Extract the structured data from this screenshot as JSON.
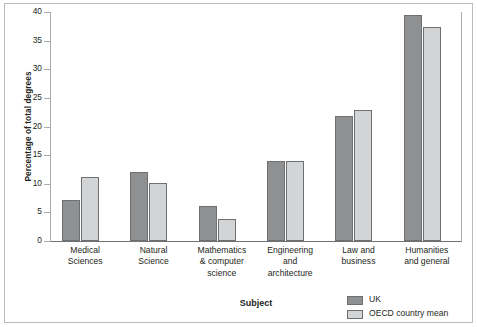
{
  "chart_data": {
    "type": "bar",
    "title": "",
    "xlabel": "Subject",
    "ylabel": "Percentage of total degrees",
    "ylim": [
      0,
      40
    ],
    "yticks": [
      0,
      5,
      10,
      15,
      20,
      25,
      30,
      35,
      40
    ],
    "grid": false,
    "legend_position": "bottom-right",
    "categories": [
      "Medical\nSciences",
      "Natural\nScience",
      "Mathematics\n& computer\nscience",
      "Engineering\nand\narchitecture",
      "Law and\nbusiness",
      "Humanities\nand general"
    ],
    "category_lines": [
      [
        "Medical",
        "Sciences"
      ],
      [
        "Natural",
        "Science"
      ],
      [
        "Mathematics",
        "& computer",
        "science"
      ],
      [
        "Engineering",
        "and",
        "architecture"
      ],
      [
        "Law and",
        "business"
      ],
      [
        "Humanities",
        "and general"
      ]
    ],
    "series": [
      {
        "name": "UK",
        "color": "#8e9092",
        "values": [
          7.2,
          12.1,
          6.1,
          14.0,
          21.8,
          39.5
        ]
      },
      {
        "name": "OECD country mean",
        "color": "#d2d4d5",
        "values": [
          11.1,
          10.1,
          3.9,
          14.0,
          22.8,
          37.4
        ]
      }
    ]
  },
  "legend": {
    "items": [
      {
        "label": "UK",
        "swatch": "uk"
      },
      {
        "label": "OECD country mean",
        "swatch": "oecd"
      }
    ]
  },
  "colors": {
    "uk_bar": "#8e9092",
    "oecd_bar": "#d2d4d5",
    "bar_outline": "#6d6f71",
    "axis": "#a8abad",
    "frame": "#b9bcbe",
    "text": "#231f20"
  }
}
